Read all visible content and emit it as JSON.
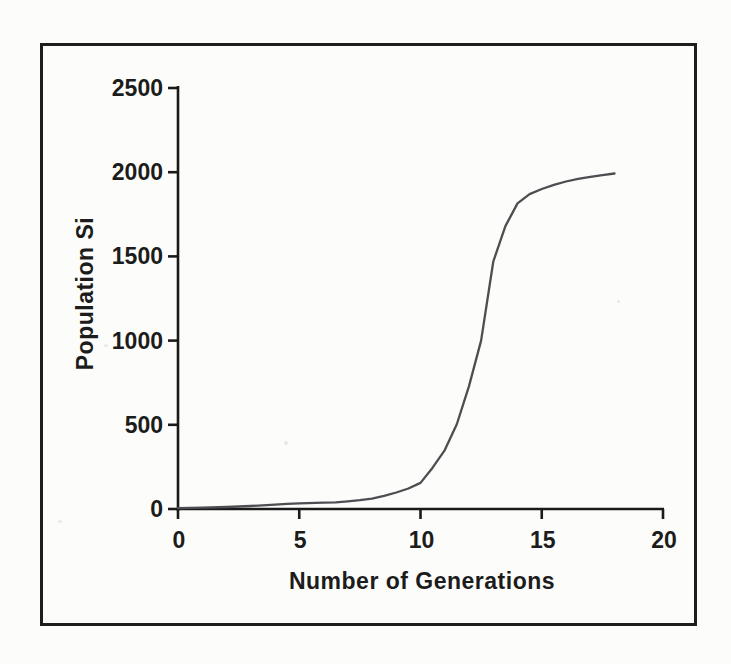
{
  "figure": {
    "background": "#fcfcfa",
    "frame_color": "#1e1e1e",
    "axis_color": "#1a1a1a",
    "curve_color": "#4e4e52",
    "text_color": "#1c1c1c"
  },
  "chart_data": {
    "type": "line",
    "title": "",
    "xlabel": "Number of Generations",
    "ylabel": "Population Si",
    "xlim": [
      0,
      20
    ],
    "ylim": [
      0,
      2500
    ],
    "x_ticks": [
      0,
      5,
      10,
      15,
      20
    ],
    "y_ticks": [
      0,
      500,
      1000,
      1500,
      2000,
      2500
    ],
    "grid": false,
    "legend": "none",
    "series": [
      {
        "name": "Population Si",
        "x": [
          0,
          1,
          2,
          3,
          4,
          4.5,
          5,
          6,
          6.5,
          7,
          7.5,
          8,
          8.5,
          9,
          9.5,
          10,
          10.5,
          11,
          11.5,
          12,
          12.5,
          13,
          13.5,
          14,
          14.5,
          15,
          15.5,
          16,
          16.5,
          17,
          17.5,
          18
        ],
        "y": [
          5,
          8,
          12,
          18,
          26,
          30,
          34,
          38,
          40,
          46,
          52,
          62,
          78,
          98,
          122,
          155,
          245,
          350,
          505,
          730,
          1000,
          1470,
          1680,
          1815,
          1870,
          1900,
          1925,
          1945,
          1960,
          1972,
          1982,
          1992
        ]
      }
    ]
  }
}
